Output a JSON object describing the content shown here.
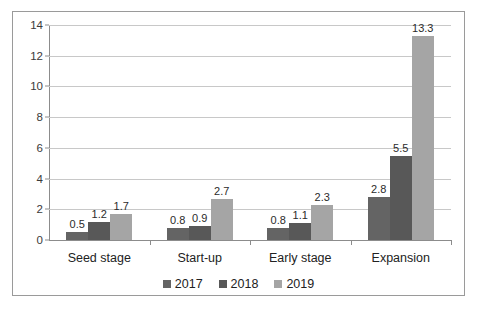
{
  "chart_data": {
    "type": "bar",
    "title": "",
    "subtitle": "",
    "xlabel": "",
    "ylabel": "",
    "categories": [
      "Seed stage",
      "Start-up",
      "Early stage",
      "Expansion"
    ],
    "series": [
      {
        "name": "2017",
        "color": "#646464",
        "values": [
          0.5,
          0.8,
          0.8,
          2.8
        ]
      },
      {
        "name": "2018",
        "color": "#585858",
        "values": [
          1.2,
          0.9,
          1.1,
          5.5
        ]
      },
      {
        "name": "2019",
        "color": "#a5a5a5",
        "values": [
          1.7,
          2.7,
          2.3,
          13.3
        ]
      }
    ],
    "data_labels": [
      [
        "0.5",
        "0.8",
        "0.8",
        "2.8"
      ],
      [
        "1.2",
        "0.9",
        "1.1",
        "5.5"
      ],
      [
        "1.7",
        "2.7",
        "2.3",
        "13.3"
      ]
    ],
    "ylim": [
      0,
      14
    ],
    "ytick_step": 2,
    "yticks": [
      "0",
      "2",
      "4",
      "6",
      "8",
      "10",
      "12",
      "14"
    ],
    "grid": true,
    "legend_position": "bottom"
  },
  "legend": {
    "items": [
      {
        "label": "2017"
      },
      {
        "label": "2018"
      },
      {
        "label": "2019"
      }
    ]
  }
}
